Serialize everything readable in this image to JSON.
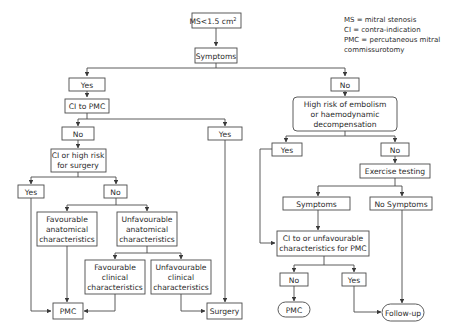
{
  "legend": [
    "MS = mitral stenosis",
    "CI = contra-indication",
    "PMC = percutaneous mitral",
    "commissurotomy"
  ],
  "nodes": {
    "start": {
      "text": "MS<1.5 cm",
      "sup": "2"
    },
    "symptoms": "Symptoms",
    "yes_symptoms": "Yes",
    "no_symptoms": "No",
    "ci_pmc": "CI to PMC",
    "ci_pmc_no": "No",
    "ci_pmc_yes": "Yes",
    "ci_surgery": [
      "CI or high risk",
      "for surgery"
    ],
    "ci_surgery_yes": "Yes",
    "ci_surgery_no": "No",
    "fav_anat": [
      "Favourable",
      "anatomical",
      "characteristics"
    ],
    "unfav_anat": [
      "Unfavourable",
      "anatomical",
      "characteristics"
    ],
    "fav_clin": [
      "Favourable",
      "clinical",
      "characteristics"
    ],
    "unfav_clin": [
      "Unfavourable",
      "clinical",
      "characteristics"
    ],
    "pmc_left": "PMC",
    "surgery": "Surgery",
    "high_risk": [
      "High risk of embolism",
      "or haemodynamic",
      "decompensation"
    ],
    "high_risk_yes": "Yes",
    "high_risk_no": "No",
    "exercise": "Exercise testing",
    "ex_symptoms": "Symptoms",
    "ex_no_symptoms": "No Symptoms",
    "ci_unfav_pmc": [
      "CI to or unfavourable",
      "characteristics for PMC"
    ],
    "final_no": "No",
    "final_yes": "Yes",
    "pmc_right": "PMC",
    "follow_up": "Follow-up"
  },
  "colors": {
    "stroke": "#4a4a4a",
    "text": "#2b2b2b",
    "background": "#ffffff"
  }
}
